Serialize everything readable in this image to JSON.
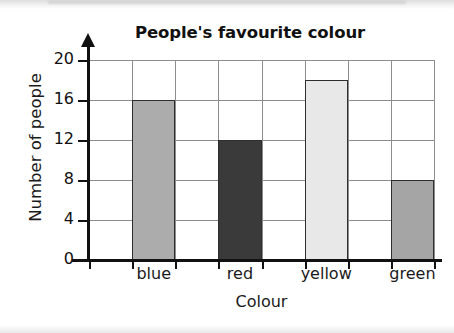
{
  "chart_data": {
    "type": "bar",
    "title": "People's favourite colour",
    "xlabel": "Colour",
    "ylabel": "Number of people",
    "categories": [
      "blue",
      "red",
      "yellow",
      "green"
    ],
    "values": [
      16,
      12,
      18,
      8
    ],
    "ylim": [
      0,
      20
    ],
    "yticks": [
      0,
      4,
      8,
      12,
      16,
      20
    ],
    "ytick_labels": [
      "0",
      "4",
      "8",
      "12",
      "16",
      "20"
    ],
    "grid": true,
    "legend": "none",
    "bar_colors": [
      "#acacac",
      "#3a3a3a",
      "#e8e8e8",
      "#a5a5a5"
    ],
    "bar_edge_color": "#2e2e2e",
    "axis_color": "#111111",
    "grid_color": "#8d8d8d"
  }
}
